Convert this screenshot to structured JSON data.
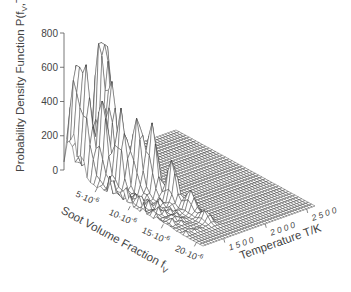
{
  "chart_data": {
    "type": "surface3d",
    "title": "",
    "zlabel": "Probability Density Function P(f_V,T)",
    "zlabel_display": "Probability Density Function P(f",
    "zlabel_sub": "V",
    "zlabel_tail": ",T)",
    "xlabel": "Soot Volume Fraction f_V",
    "xlabel_display": "Soot Volume Fraction f",
    "xlabel_sub": "V",
    "ylabel": "Temperature T/K",
    "z_ticks": [
      0,
      200,
      400,
      600,
      800
    ],
    "zlim": [
      0,
      800
    ],
    "x_ticks": [
      {
        "value": 5e-06,
        "label": "5·10",
        "exp": "-6"
      },
      {
        "value": 1e-05,
        "label": "10·10",
        "exp": "-6"
      },
      {
        "value": 1.5e-05,
        "label": "15·10",
        "exp": "-6"
      },
      {
        "value": 2e-05,
        "label": "20·10",
        "exp": "-6"
      }
    ],
    "xlim": [
      0,
      2.1e-05
    ],
    "y_ticks": [
      {
        "value": 1500,
        "label": "1 5 0 0"
      },
      {
        "value": 2000,
        "label": "2 0 0 0"
      },
      {
        "value": 2500,
        "label": "2 5 0 0"
      }
    ],
    "ylim": [
      1250,
      2600
    ],
    "grid": false,
    "legend": null,
    "surface_description": "Joint PDF of soot volume fraction and temperature; high narrow ridges (up to ~640) at low-to-mid f_V and low temperatures (~1250-1650 K), decaying toward higher f_V; near-zero plateau at higher temperatures.",
    "peaks": [
      {
        "fv": 1e-06,
        "T": 1300,
        "P": 560
      },
      {
        "fv": 2.5e-06,
        "T": 1320,
        "P": 600
      },
      {
        "fv": 4.5e-06,
        "T": 1360,
        "P": 480
      },
      {
        "fv": 6.5e-06,
        "T": 1420,
        "P": 430
      },
      {
        "fv": 8e-06,
        "T": 1500,
        "P": 450
      },
      {
        "fv": 9.5e-06,
        "T": 1560,
        "P": 420
      },
      {
        "fv": 1.2e-05,
        "T": 1600,
        "P": 250
      },
      {
        "fv": 1.45e-05,
        "T": 1620,
        "P": 120
      },
      {
        "fv": 1.7e-05,
        "T": 1600,
        "P": 60
      },
      {
        "fv": 1e-06,
        "T": 1600,
        "P": 640
      },
      {
        "fv": 1.5e-06,
        "T": 1640,
        "P": 630
      },
      {
        "fv": 3e-06,
        "T": 1580,
        "P": 520
      }
    ]
  }
}
